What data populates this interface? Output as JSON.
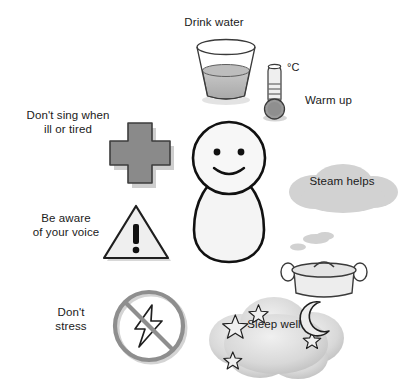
{
  "poster": {
    "title": "Voice care tips illustration",
    "background_color": "#ffffff",
    "width": 413,
    "height": 392
  },
  "palette": {
    "outline": "#1a1a1a",
    "text": "#1a1a1a",
    "fill_light": "#f2f2f2",
    "fill_mid": "#b4b4b4",
    "fill_grey": "#8c8c8c",
    "cloud_grey": "#cfcfcf",
    "shadow": "#9a9a9a"
  },
  "labels": {
    "drink_water": "Drink water",
    "warm_up": "Warm up",
    "dont_sing": "Don't sing when\nill or tired",
    "be_aware": "Be aware\nof your voice",
    "dont_stress": "Don't\nstress",
    "steam_helps": "Steam helps",
    "sleep_well": "Sleep well",
    "celsius": "°C"
  },
  "icons": {
    "glass": "glass-of-water-icon",
    "thermometer": "thermometer-icon",
    "cross": "medical-cross-icon",
    "person": "person-figure-icon",
    "triangle": "warning-triangle-icon",
    "ban": "no-stress-prohibition-icon",
    "steam_cloud": "steam-cloud-icon",
    "pot": "cooking-pot-icon",
    "sleep_cloud": "sleep-cloud-icon",
    "moon": "crescent-moon-icon",
    "stars": "star-icon"
  },
  "tips": [
    {
      "id": "drink-water",
      "label": "Drink water",
      "icon": "glass-of-water-icon"
    },
    {
      "id": "warm-up",
      "label": "Warm up",
      "icon": "thermometer-icon"
    },
    {
      "id": "dont-sing",
      "label": "Don't sing when ill or tired",
      "icon": "medical-cross-icon"
    },
    {
      "id": "be-aware",
      "label": "Be aware of your voice",
      "icon": "warning-triangle-icon"
    },
    {
      "id": "dont-stress",
      "label": "Don't stress",
      "icon": "no-stress-prohibition-icon"
    },
    {
      "id": "steam-helps",
      "label": "Steam helps",
      "icon": "cooking-pot-icon"
    },
    {
      "id": "sleep-well",
      "label": "Sleep well",
      "icon": "sleep-cloud-icon"
    }
  ]
}
